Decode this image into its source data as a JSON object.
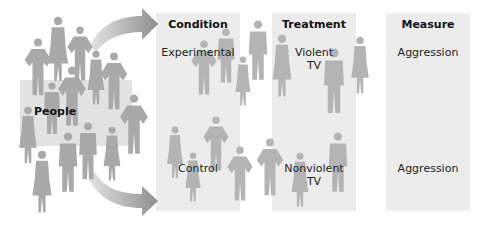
{
  "diagram": {
    "source_group": {
      "label": "People"
    },
    "columns": [
      {
        "header": "Condition",
        "rows": [
          "Experimental",
          "Control"
        ]
      },
      {
        "header": "Treatment",
        "rows": [
          "Violent\nTV",
          "Nonviolent\nTV"
        ]
      },
      {
        "header": "Measure",
        "rows": [
          "Aggression",
          "Aggression"
        ]
      }
    ],
    "arrows": [
      {
        "from": "People",
        "to": "Experimental"
      },
      {
        "from": "People",
        "to": "Control"
      }
    ],
    "colors": {
      "panel": "#ececec",
      "people_panel": "#e2e2e2",
      "silhouette": "#a9a9a9",
      "arrow": "#9a9a9a",
      "text": "#222222"
    }
  }
}
